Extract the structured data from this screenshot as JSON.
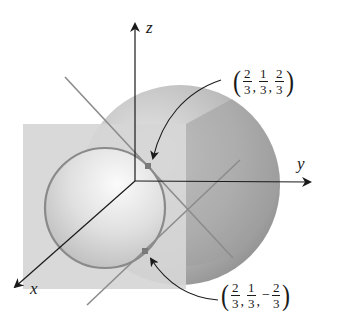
{
  "figure": {
    "axes": {
      "x_label": "x",
      "y_label": "y",
      "z_label": "z"
    },
    "points": [
      {
        "id": "point-upper",
        "coords": [
          "2/3",
          "1/3",
          "2/3"
        ],
        "label": {
          "open": "(",
          "close": ")",
          "parts": [
            {
              "sign": "",
              "num": "2",
              "den": "3"
            },
            {
              "sign": "",
              "num": "1",
              "den": "3"
            },
            {
              "sign": "",
              "num": "2",
              "den": "3"
            }
          ],
          "separator": ","
        }
      },
      {
        "id": "point-lower",
        "coords": [
          "2/3",
          "1/3",
          "-2/3"
        ],
        "label": {
          "open": "(",
          "close": ")",
          "parts": [
            {
              "sign": "",
              "num": "2",
              "den": "3"
            },
            {
              "sign": "",
              "num": "1",
              "den": "3"
            },
            {
              "sign": "−",
              "num": "2",
              "den": "3"
            }
          ],
          "separator": ","
        }
      }
    ],
    "colors": {
      "background": "#ffffff",
      "sphere_light": "#ececec",
      "sphere_dark": "#9a9a9a",
      "plane": "#d9d9d9",
      "circle": "#8a8a8a",
      "lines": "#8c8c8c",
      "axes": "#1a1a1a",
      "point_marker": "#7a7a7a"
    }
  }
}
